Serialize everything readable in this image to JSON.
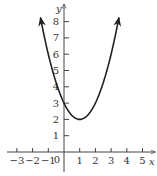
{
  "chart_data": {
    "type": "line",
    "title": "",
    "function": "y = x^2 - 2x + 3",
    "xlabel": "x",
    "ylabel": "y",
    "xlim": [
      -3.5,
      5.7
    ],
    "ylim": [
      -1.2,
      9
    ],
    "grid": false,
    "legend": null,
    "x_ticks": [
      -3,
      -2,
      -1,
      1,
      2,
      3,
      4,
      5
    ],
    "x_tick_labels": [
      "−3",
      "−2",
      "−1",
      "1",
      "2",
      "3",
      "4",
      "5"
    ],
    "y_ticks": [
      1,
      2,
      3,
      4,
      5,
      6,
      7,
      8
    ],
    "y_tick_labels": [
      "1",
      "2",
      "3",
      "4",
      "5",
      "6",
      "7",
      "8"
    ],
    "origin_label": "0",
    "series": [
      {
        "name": "parabola",
        "vertex": [
          1,
          2
        ],
        "x": [
          -1.5,
          -1,
          -0.5,
          0,
          0.5,
          1,
          1.5,
          2,
          2.5,
          3,
          3.5
        ],
        "y": [
          8.25,
          6,
          4.25,
          3,
          2.25,
          2,
          2.25,
          3,
          4.25,
          6,
          8.25
        ],
        "arrows_at_ends": true
      }
    ]
  }
}
